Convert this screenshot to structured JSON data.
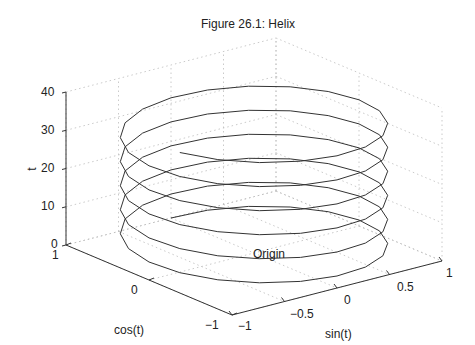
{
  "chart_data": {
    "type": "line",
    "subtype": "3d-line",
    "title": "Figure 26.1: Helix",
    "xlabel": "sin(t)",
    "ylabel": "cos(t)",
    "zlabel": "t",
    "function": "x = sin(t), y = cos(t), z = t",
    "t_range": [
      0,
      36
    ],
    "x_ticks": [
      "−1",
      "−0.5",
      "0",
      "0.5",
      "1"
    ],
    "y_ticks": [
      "−1",
      "0",
      "1"
    ],
    "z_ticks": [
      "0",
      "10",
      "20",
      "30",
      "40"
    ],
    "xlim": [
      -1,
      1
    ],
    "ylim": [
      -1,
      1
    ],
    "zlim": [
      0,
      40
    ],
    "grid": true,
    "annotations": [
      {
        "text": "Origin",
        "x": 0,
        "y": 0,
        "z": 0
      }
    ],
    "series": [
      {
        "name": "helix",
        "turns": 5.7
      }
    ]
  },
  "figure": {
    "title": "Figure 26.1: Helix",
    "axis_labels": {
      "x": "sin(t)",
      "y": "cos(t)",
      "z": "t"
    },
    "z_ticks": [
      "0",
      "10",
      "20",
      "30",
      "40"
    ],
    "x_ticks": [
      "−1",
      "−0.5",
      "0",
      "0.5",
      "1"
    ],
    "y_ticks": [
      "−1",
      "0",
      "1"
    ],
    "annotation": "Origin"
  }
}
